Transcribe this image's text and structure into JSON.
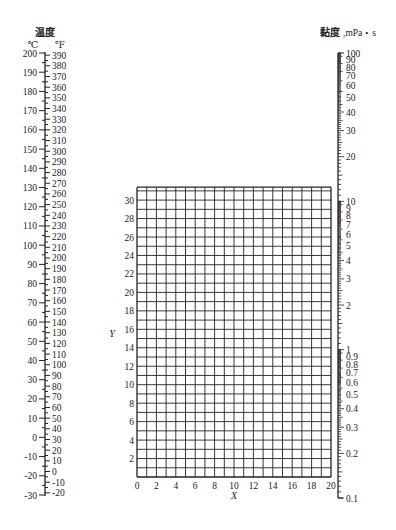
{
  "chart_data": {
    "type": "nomogram",
    "temperature_scale": {
      "title": "温度",
      "celsius_unit": "℃",
      "fahrenheit_unit": "℉",
      "celsius_range": [
        -30,
        200
      ],
      "celsius_major_ticks": [
        200,
        190,
        180,
        170,
        160,
        150,
        140,
        130,
        120,
        110,
        100,
        90,
        80,
        70,
        60,
        50,
        40,
        30,
        20,
        10,
        0,
        -10,
        -20,
        -30
      ],
      "fahrenheit_range": [
        -20,
        390
      ],
      "fahrenheit_major_ticks": [
        390,
        380,
        370,
        360,
        350,
        340,
        330,
        320,
        310,
        300,
        290,
        280,
        270,
        260,
        250,
        240,
        230,
        220,
        210,
        200,
        190,
        180,
        170,
        160,
        150,
        140,
        130,
        120,
        110,
        100,
        90,
        80,
        70,
        60,
        50,
        40,
        30,
        20,
        10,
        0,
        -10,
        -20
      ]
    },
    "viscosity_scale": {
      "title": "黏度",
      "unit": "mPa・s",
      "scale": "log",
      "range": [
        0.1,
        100
      ],
      "labeled_ticks": [
        100,
        90,
        80,
        70,
        60,
        50,
        40,
        30,
        20,
        10,
        9,
        8,
        7,
        6,
        5,
        4,
        3,
        2,
        1,
        0.9,
        0.8,
        0.7,
        0.6,
        0.5,
        0.4,
        0.3,
        0.2,
        0.1
      ]
    },
    "grid": {
      "xlabel": "X",
      "ylabel": "Y",
      "xlim": [
        0,
        20
      ],
      "ylim": [
        0,
        31.4
      ],
      "x_ticks": [
        0,
        2,
        4,
        6,
        8,
        10,
        12,
        14,
        16,
        18,
        20
      ],
      "y_ticks": [
        2,
        4,
        6,
        8,
        10,
        12,
        14,
        16,
        18,
        20,
        22,
        24,
        26,
        28,
        30
      ],
      "grid_step": 1,
      "grid_on": true
    }
  },
  "labels": {
    "temp_title": "温度",
    "celsius_unit": "℃",
    "fahrenheit_unit": "℉",
    "visc_title": "黏度",
    "visc_unit": ",mPa・s",
    "x_axis": "X",
    "y_axis": "Y"
  },
  "colors": {
    "line": "#222222",
    "text": "#222222",
    "background": "#ffffff"
  }
}
